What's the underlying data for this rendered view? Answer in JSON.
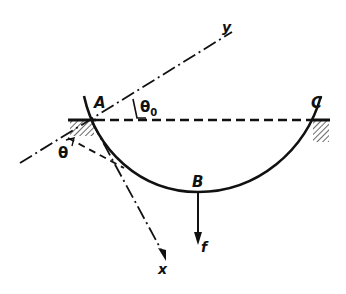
{
  "diagram": {
    "type": "mechanics-arc-beam",
    "colors": {
      "ink": "#111111",
      "background": "#ffffff",
      "hatch": "#555555"
    },
    "points": {
      "A": {
        "label": "A",
        "description": "left fixed support"
      },
      "B": {
        "label": "B",
        "description": "lowest point of arc, load applied"
      },
      "C": {
        "label": "C",
        "description": "right fixed support"
      }
    },
    "axes": {
      "x": {
        "label": "x"
      },
      "y": {
        "label": "y"
      }
    },
    "angles": {
      "theta0": {
        "label": "θ",
        "subscript": "0"
      },
      "theta": {
        "label": "θ"
      }
    },
    "load": {
      "label": "f",
      "direction": "down"
    },
    "lines": {
      "chord": "dashed horizontal line A–C",
      "tangent": "dashed tangent line at A",
      "axes_style": "dash-dot"
    }
  }
}
